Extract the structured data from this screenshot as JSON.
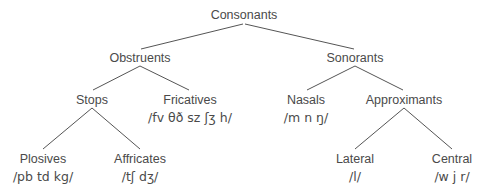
{
  "diagram": {
    "title": "Consonants",
    "type": "tree",
    "nodes": {
      "consonants": {
        "label": "Consonants"
      },
      "obstruents": {
        "label": "Obstruents"
      },
      "sonorants": {
        "label": "Sonorants"
      },
      "stops": {
        "label": "Stops"
      },
      "fricatives": {
        "label": "Fricatives",
        "ipa": "/fv θð sz ʃʒ h/"
      },
      "nasals": {
        "label": "Nasals",
        "ipa": "/m n ŋ/"
      },
      "approximants": {
        "label": "Approximants"
      },
      "plosives": {
        "label": "Plosives",
        "ipa": "/pb td kg/"
      },
      "affricates": {
        "label": "Affricates",
        "ipa": "/tʃ dʒ/"
      },
      "lateral": {
        "label": "Lateral",
        "ipa": "/l/"
      },
      "central": {
        "label": "Central",
        "ipa": "/w j r/"
      }
    },
    "edges": [
      [
        "consonants",
        "obstruents"
      ],
      [
        "consonants",
        "sonorants"
      ],
      [
        "obstruents",
        "stops"
      ],
      [
        "obstruents",
        "fricatives"
      ],
      [
        "sonorants",
        "nasals"
      ],
      [
        "sonorants",
        "approximants"
      ],
      [
        "stops",
        "plosives"
      ],
      [
        "stops",
        "affricates"
      ],
      [
        "approximants",
        "lateral"
      ],
      [
        "approximants",
        "central"
      ]
    ]
  }
}
